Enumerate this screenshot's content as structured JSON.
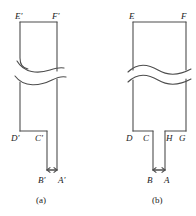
{
  "figure": {
    "title": "",
    "style": {
      "stroke": "#4d4d4d",
      "stroke_width": 1.1,
      "background": "#ffffff",
      "label_color": "#1a1a1a"
    },
    "panels": [
      {
        "id": "a",
        "caption": "(a)",
        "caption_pos": {
          "x": 41,
          "y": 196
        },
        "description": "Notched bar specimen with primed vertex labels and a wavy break in the shank",
        "vertices": [
          {
            "name": "E'",
            "label": "E'",
            "x": 20,
            "y": 22,
            "label_x": 15,
            "label_y": 12
          },
          {
            "name": "F'",
            "label": "F'",
            "x": 57,
            "y": 22,
            "label_x": 52,
            "label_y": 12
          },
          {
            "name": "D'",
            "label": "D'",
            "x": 20,
            "y": 131,
            "label_x": 13,
            "label_y": 135
          },
          {
            "name": "C'",
            "label": "C'",
            "x": 47,
            "y": 131,
            "label_x": 38,
            "label_y": 135
          },
          {
            "name": "B'",
            "label": "B'",
            "x": 47,
            "y": 172,
            "label_x": 39,
            "label_y": 176
          },
          {
            "name": "A'",
            "label": "A'",
            "x": 57,
            "y": 172,
            "label_x": 58,
            "label_y": 176
          }
        ],
        "break": {
          "y_upper": 68,
          "y_lower": 80
        },
        "dimension_line": {
          "x1": 47,
          "x2": 57,
          "y": 170
        }
      },
      {
        "id": "b",
        "caption": "(b)",
        "caption_pos": {
          "x": 156,
          "y": 196
        },
        "description": "Symmetric notched bar specimen with unprimed vertex labels and a wavy break in the shank",
        "vertices": [
          {
            "name": "E",
            "label": "E",
            "x": 133,
            "y": 22,
            "label_x": 129,
            "label_y": 12
          },
          {
            "name": "F",
            "label": "F",
            "x": 186,
            "y": 22,
            "label_x": 181,
            "label_y": 12
          },
          {
            "name": "D",
            "label": "D",
            "x": 133,
            "y": 131,
            "label_x": 128,
            "label_y": 135
          },
          {
            "name": "C",
            "label": "C",
            "x": 153,
            "y": 131,
            "label_x": 144,
            "label_y": 135
          },
          {
            "name": "H",
            "label": "H",
            "x": 165,
            "y": 131,
            "label_x": 166,
            "label_y": 135
          },
          {
            "name": "G",
            "label": "G",
            "x": 186,
            "y": 131,
            "label_x": 181,
            "label_y": 135
          },
          {
            "name": "B",
            "label": "B",
            "x": 153,
            "y": 172,
            "label_x": 147,
            "label_y": 176
          },
          {
            "name": "A",
            "label": "A",
            "x": 165,
            "y": 172,
            "label_x": 165,
            "label_y": 176
          }
        ],
        "break": {
          "y_upper": 68,
          "y_lower": 80
        },
        "dimension_line": {
          "x1": 153,
          "x2": 165,
          "y": 170
        }
      }
    ]
  }
}
